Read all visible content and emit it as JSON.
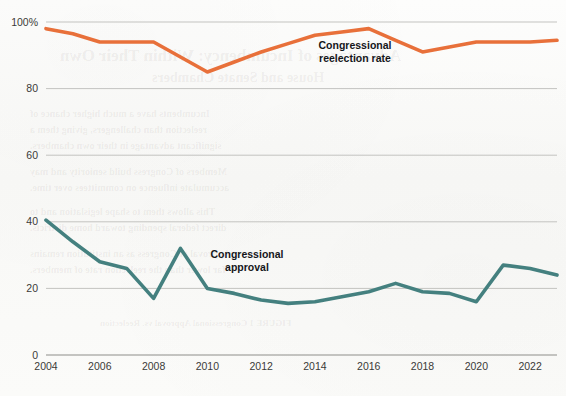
{
  "figure": {
    "background_color": "#fbfbfa",
    "plot_left_px": 46,
    "plot_right_px": 557,
    "plot_top_px": 22,
    "plot_bottom_px": 355
  },
  "chart_data": {
    "type": "line",
    "title": "",
    "subtitle": "",
    "xlabel": "",
    "ylabel": "",
    "xlim": [
      2004,
      2023
    ],
    "ylim": [
      0,
      100
    ],
    "grid": true,
    "grid_axis": "y",
    "legend_position": "inline-annotations",
    "x_tick_labels": [
      "2004",
      "2006",
      "2008",
      "2010",
      "2012",
      "2014",
      "2016",
      "2018",
      "2020",
      "2022"
    ],
    "x_tick_values": [
      2004,
      2006,
      2008,
      2010,
      2012,
      2014,
      2016,
      2018,
      2020,
      2022
    ],
    "y_tick_labels": [
      "0",
      "20",
      "40",
      "60",
      "80",
      "100%"
    ],
    "y_tick_values": [
      0,
      20,
      40,
      60,
      80,
      100
    ],
    "x": [
      2004,
      2005,
      2006,
      2007,
      2008,
      2009,
      2010,
      2011,
      2012,
      2013,
      2014,
      2015,
      2016,
      2017,
      2018,
      2019,
      2020,
      2021,
      2022,
      2023
    ],
    "series": [
      {
        "name": "Congressional reelection rate",
        "color": "#e8703a",
        "line_width": 3.6,
        "annotation": {
          "line1": "Congressional",
          "line2": "reelection rate",
          "x_px": 355,
          "y_px": 49
        },
        "values": [
          98,
          96.5,
          94,
          94,
          94,
          89.5,
          85,
          88,
          91,
          93.5,
          96,
          97,
          98,
          94.5,
          91,
          92.5,
          94,
          94,
          94,
          94.5
        ]
      },
      {
        "name": "Congressional approval",
        "color": "#44807f",
        "line_width": 3.6,
        "annotation": {
          "line1": "Congressional",
          "line2": "approval",
          "x_px": 247,
          "y_px": 258
        },
        "values": [
          40.5,
          34,
          28,
          26,
          17,
          32,
          20,
          18.5,
          16.5,
          15.5,
          16,
          17.5,
          19,
          21.5,
          19,
          18.5,
          16,
          27,
          26,
          24
        ]
      }
    ]
  },
  "bleed_through_text": [
    {
      "text": "Advantages of Incumbency: Within Their Own",
      "x": 60,
      "y": 46,
      "size": 17
    },
    {
      "text": "House and Senate Chambers",
      "x": 152,
      "y": 70,
      "size": 14
    },
    {
      "text": "Incumbents have a much higher chance of",
      "x": 30,
      "y": 108,
      "size": 10
    },
    {
      "text": "reelection than challengers, giving them a",
      "x": 30,
      "y": 124,
      "size": 10
    },
    {
      "text": "significant advantage in their own chambers.",
      "x": 30,
      "y": 140,
      "size": 10
    },
    {
      "text": "Members of Congress build seniority and may",
      "x": 30,
      "y": 166,
      "size": 10
    },
    {
      "text": "accumulate influence on committees over time.",
      "x": 30,
      "y": 182,
      "size": 10
    },
    {
      "text": "This allows them to shape legislation and to",
      "x": 30,
      "y": 206,
      "size": 10
    },
    {
      "text": "direct federal spending toward home districts.",
      "x": 30,
      "y": 222,
      "size": 10
    },
    {
      "text": "Approval of Congress as an institution remains",
      "x": 30,
      "y": 248,
      "size": 10
    },
    {
      "text": "far lower than the reelection rate of members.",
      "x": 30,
      "y": 264,
      "size": 10
    },
    {
      "text": "FIGURE 1   Congressional Approval vs. Reelection",
      "x": 100,
      "y": 318,
      "size": 9
    }
  ]
}
